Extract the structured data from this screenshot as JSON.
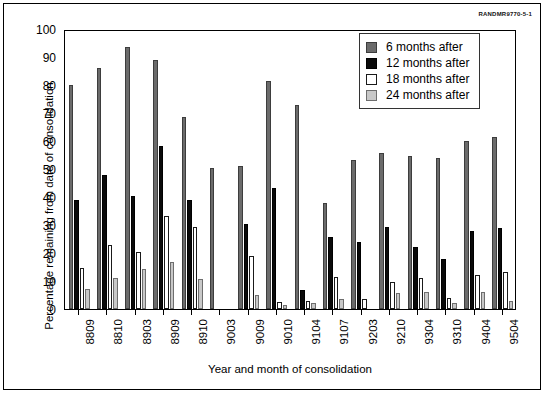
{
  "figure": {
    "doc_id": "RANDMR9770-5-1"
  },
  "chart_data": {
    "type": "bar",
    "title": "",
    "xlabel": "Year and month of consolidation",
    "ylabel": "Percentage remaining from date of consolidation",
    "ylim": [
      0,
      100
    ],
    "ytick_step": 10,
    "yticks": [
      0,
      10,
      20,
      30,
      40,
      50,
      60,
      70,
      80,
      90,
      100
    ],
    "grid": false,
    "legend_position": "top-right",
    "categories": [
      "8809",
      "8810",
      "8903",
      "8909",
      "8910",
      "9003",
      "9009",
      "9010",
      "9104",
      "9107",
      "9203",
      "9210",
      "9304",
      "9310",
      "9404",
      "9504"
    ],
    "series": [
      {
        "name": "6 months after",
        "color": "#6b6b6b",
        "values": [
          80.0,
          86.0,
          93.5,
          89.0,
          68.5,
          50.4,
          51.2,
          81.5,
          72.8,
          37.8,
          53.3,
          55.7,
          54.7,
          54.0,
          60.0,
          61.3
        ]
      },
      {
        "name": "12 months after",
        "color": "#0a0a0a",
        "values": [
          39.0,
          48.0,
          40.5,
          58.3,
          39.0,
          0.0,
          30.3,
          43.2,
          6.8,
          25.7,
          23.8,
          29.3,
          22.0,
          17.7,
          28.0,
          28.8
        ]
      },
      {
        "name": "18 months after",
        "color": "#ffffff",
        "values": [
          14.8,
          23.0,
          20.5,
          33.3,
          29.3,
          0.0,
          19.0,
          2.5,
          2.8,
          11.5,
          3.7,
          9.7,
          11.0,
          3.8,
          12.2,
          13.2
        ]
      },
      {
        "name": "24 months after",
        "color": "#c8c8c8",
        "values": [
          7.0,
          11.0,
          14.3,
          16.7,
          10.8,
          0.0,
          5.0,
          1.3,
          2.0,
          3.7,
          0.0,
          5.8,
          6.0,
          2.0,
          6.1,
          2.8
        ]
      }
    ]
  }
}
